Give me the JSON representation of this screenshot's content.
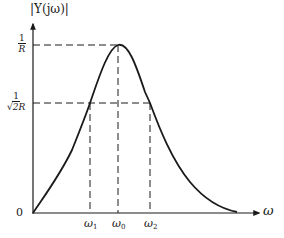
{
  "figure": {
    "y_axis_label": "|Y(jω)|",
    "x_axis_label": "ω",
    "origin_label": "0",
    "y_ticks": [
      {
        "numerator": "1",
        "denominator": "R"
      },
      {
        "numerator": "1",
        "denominator": "√2R"
      }
    ],
    "x_ticks": [
      {
        "symbol": "ω",
        "subscript": "1"
      },
      {
        "symbol": "ω",
        "subscript": "0"
      },
      {
        "symbol": "ω",
        "subscript": "2"
      }
    ],
    "colors": {
      "ink": "#1a1a1a",
      "background": "#ffffff"
    }
  }
}
